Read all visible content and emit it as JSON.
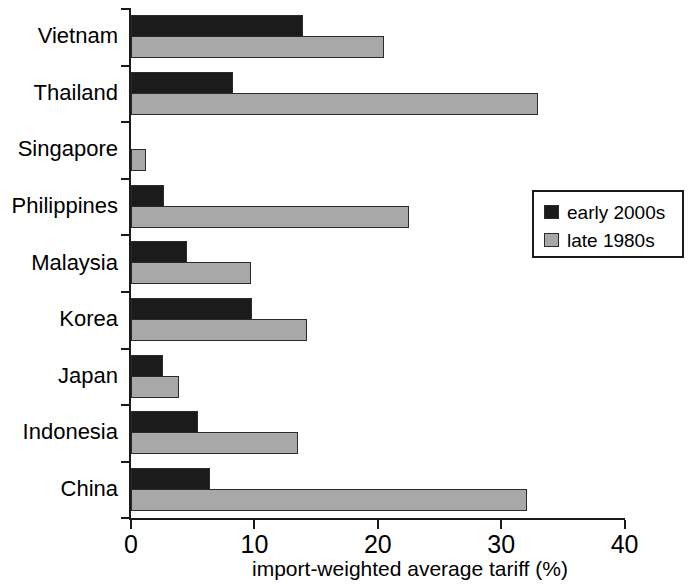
{
  "chart_data": {
    "type": "bar",
    "orientation": "horizontal",
    "title": "",
    "xlabel": "import-weighted average tariff (%)",
    "ylabel": "",
    "xlim": [
      0,
      40
    ],
    "xticks": [
      0,
      10,
      20,
      30,
      40
    ],
    "xtick_labels": [
      "0",
      "10",
      "20",
      "30",
      "40"
    ],
    "grid": false,
    "legend_position": "right",
    "categories": [
      "Vietnam",
      "Thailand",
      "Singapore",
      "Philippines",
      "Malaysia",
      "Korea",
      "Japan",
      "Indonesia",
      "China"
    ],
    "series": [
      {
        "name": "early 2000s",
        "color": "#1b1b1b",
        "values": [
          13.9,
          8.3,
          0.0,
          2.7,
          4.5,
          9.8,
          2.6,
          5.4,
          6.4
        ]
      },
      {
        "name": "late 1980s",
        "color": "#a8a8a8",
        "values": [
          20.5,
          33.0,
          1.2,
          22.5,
          9.7,
          14.3,
          3.9,
          13.5,
          32.1
        ]
      }
    ]
  },
  "legend": {
    "items": [
      {
        "label": "early 2000s",
        "swatch": "early"
      },
      {
        "label": "late 1980s",
        "swatch": "late"
      }
    ]
  }
}
